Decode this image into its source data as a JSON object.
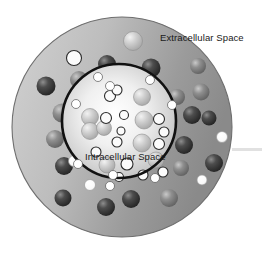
{
  "diagram": {
    "background_color": "#ffffff",
    "labels": {
      "extracellular": "Extracellular Space",
      "intracellular": "Intracellular Space"
    },
    "colors": {
      "outer_disc_light": "#c9c9c9",
      "outer_disc_dark": "#8d8d8d",
      "outer_disc_border": "#6e6e6e",
      "inner_fill_center": "#fdfdfd",
      "inner_fill_edge": "#c2c2c2",
      "membrane_line": "#111111",
      "sphere_dark": "#3a3a3a",
      "sphere_mid": "#7c7c7c",
      "sphere_light": "#b9b9b9",
      "circle_outline": "#2b2b2b",
      "circle_fill": "#fbfbfb",
      "label_text": "#1a1a1a",
      "streak": "#d8d8d8"
    },
    "outer_disc": {
      "cx": 122,
      "cy": 127,
      "r": 110
    },
    "membrane": {
      "cx": 119,
      "cy": 121,
      "r": 57,
      "stroke_width": 2.6
    },
    "label_positions": {
      "extracellular": {
        "x": 160,
        "y": 41
      },
      "intracellular": {
        "x": 85,
        "y": 160
      }
    },
    "streak": {
      "x": 232,
      "y": 148,
      "width": 30,
      "height": 3
    },
    "outer_spheres": [
      {
        "cx": 133,
        "cy": 41,
        "r": 9.5,
        "tone": "light"
      },
      {
        "cx": 74,
        "cy": 58,
        "r": 7.5,
        "tone": "outline"
      },
      {
        "cx": 106,
        "cy": 77,
        "r": 5.0,
        "tone": "outline"
      },
      {
        "cx": 107,
        "cy": 64,
        "r": 9.0,
        "tone": "dark"
      },
      {
        "cx": 151,
        "cy": 68,
        "r": 9.5,
        "tone": "dark"
      },
      {
        "cx": 198,
        "cy": 66,
        "r": 8.0,
        "tone": "mid"
      },
      {
        "cx": 46,
        "cy": 86,
        "r": 9.5,
        "tone": "dark"
      },
      {
        "cx": 79,
        "cy": 80,
        "r": 9.0,
        "tone": "mid"
      },
      {
        "cx": 201,
        "cy": 92,
        "r": 8.5,
        "tone": "mid"
      },
      {
        "cx": 177,
        "cy": 97,
        "r": 8.0,
        "tone": "mid"
      },
      {
        "cx": 62,
        "cy": 113,
        "r": 9.5,
        "tone": "mid"
      },
      {
        "cx": 192,
        "cy": 115,
        "r": 9.0,
        "tone": "dark"
      },
      {
        "cx": 209,
        "cy": 118,
        "r": 7.5,
        "tone": "dark"
      },
      {
        "cx": 55,
        "cy": 139,
        "r": 9.0,
        "tone": "mid"
      },
      {
        "cx": 184,
        "cy": 145,
        "r": 9.0,
        "tone": "dark"
      },
      {
        "cx": 222,
        "cy": 137,
        "r": 5.5,
        "tone": "white"
      },
      {
        "cx": 64,
        "cy": 166,
        "r": 9.0,
        "tone": "dark"
      },
      {
        "cx": 214,
        "cy": 163,
        "r": 9.0,
        "tone": "dark"
      },
      {
        "cx": 181,
        "cy": 168,
        "r": 8.0,
        "tone": "mid"
      },
      {
        "cx": 202,
        "cy": 180,
        "r": 5.0,
        "tone": "white"
      },
      {
        "cx": 63,
        "cy": 198,
        "r": 8.5,
        "tone": "dark"
      },
      {
        "cx": 106,
        "cy": 207,
        "r": 9.0,
        "tone": "dark"
      },
      {
        "cx": 131,
        "cy": 199,
        "r": 9.0,
        "tone": "dark"
      },
      {
        "cx": 169,
        "cy": 198,
        "r": 9.0,
        "tone": "mid"
      },
      {
        "cx": 90,
        "cy": 185,
        "r": 5.5,
        "tone": "white"
      },
      {
        "cx": 74,
        "cy": 161,
        "r": 5.5,
        "tone": "white"
      },
      {
        "cx": 72,
        "cy": 104,
        "r": 5.5,
        "tone": "white"
      },
      {
        "cx": 96,
        "cy": 77,
        "r": 5.0,
        "tone": "white"
      }
    ],
    "membrane_dots": [
      {
        "cx": 98,
        "cy": 77,
        "r": 4.5
      },
      {
        "cx": 110,
        "cy": 86,
        "r": 4.5
      },
      {
        "cx": 150,
        "cy": 80,
        "r": 4.5
      },
      {
        "cx": 172,
        "cy": 105,
        "r": 4.5
      },
      {
        "cx": 76,
        "cy": 104,
        "r": 4.5
      },
      {
        "cx": 78,
        "cy": 164,
        "r": 4.5
      },
      {
        "cx": 110,
        "cy": 186,
        "r": 4.5
      },
      {
        "cx": 155,
        "cy": 178,
        "r": 4.5
      },
      {
        "cx": 113,
        "cy": 175,
        "r": 4.5
      }
    ],
    "inner_spheres": [
      {
        "cx": 90,
        "cy": 117,
        "r": 8.5,
        "tone": "light"
      },
      {
        "cx": 90,
        "cy": 131,
        "r": 8.5,
        "tone": "light"
      },
      {
        "cx": 104,
        "cy": 128,
        "r": 7.5,
        "tone": "light"
      },
      {
        "cx": 142,
        "cy": 97,
        "r": 8.5,
        "tone": "light"
      },
      {
        "cx": 144,
        "cy": 120,
        "r": 9.0,
        "tone": "light"
      },
      {
        "cx": 142,
        "cy": 143,
        "r": 9.0,
        "tone": "light"
      },
      {
        "cx": 156,
        "cy": 160,
        "r": 8.0,
        "tone": "light"
      },
      {
        "cx": 107,
        "cy": 165,
        "r": 8.0,
        "tone": "light"
      },
      {
        "cx": 127,
        "cy": 164,
        "r": 6.0,
        "tone": "outline"
      },
      {
        "cx": 110,
        "cy": 96,
        "r": 5.5,
        "tone": "outline"
      },
      {
        "cx": 117,
        "cy": 90,
        "r": 5.0,
        "tone": "outline"
      },
      {
        "cx": 106,
        "cy": 118,
        "r": 5.5,
        "tone": "outline"
      },
      {
        "cx": 124,
        "cy": 115,
        "r": 4.5,
        "tone": "outline"
      },
      {
        "cx": 117,
        "cy": 142,
        "r": 5.0,
        "tone": "outline"
      },
      {
        "cx": 121,
        "cy": 131,
        "r": 4.0,
        "tone": "outline"
      },
      {
        "cx": 159,
        "cy": 119,
        "r": 5.5,
        "tone": "outline"
      },
      {
        "cx": 164,
        "cy": 132,
        "r": 5.0,
        "tone": "outline"
      },
      {
        "cx": 159,
        "cy": 144,
        "r": 5.5,
        "tone": "outline"
      },
      {
        "cx": 143,
        "cy": 175,
        "r": 5.0,
        "tone": "outline"
      },
      {
        "cx": 163,
        "cy": 172,
        "r": 5.0,
        "tone": "outline"
      },
      {
        "cx": 96,
        "cy": 152,
        "r": 5.0,
        "tone": "outline"
      },
      {
        "cx": 119,
        "cy": 177,
        "r": 4.5,
        "tone": "outline"
      }
    ]
  }
}
